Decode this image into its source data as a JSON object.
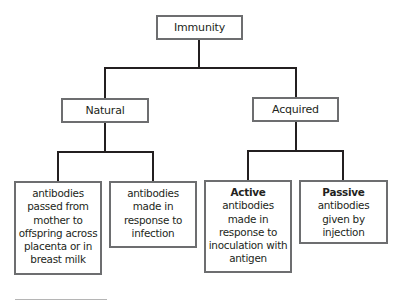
{
  "diagram": {
    "root": {
      "label": "Immunity"
    },
    "branches": [
      {
        "label": "Natural",
        "children": [
          {
            "title": "",
            "lines": [
              "antibodies",
              "passed from",
              "mother to",
              "offspring across",
              "placenta or in",
              "breast milk"
            ]
          },
          {
            "title": "",
            "lines": [
              "antibodies",
              "made in",
              "response to",
              "infection"
            ]
          }
        ]
      },
      {
        "label": "Acquired",
        "children": [
          {
            "title": "Active",
            "lines": [
              "antibodies",
              "made in",
              "response to",
              "inoculation with",
              "antigen"
            ]
          },
          {
            "title": "Passive",
            "lines": [
              "antibodies",
              "given by",
              "injection"
            ]
          }
        ]
      }
    ]
  }
}
